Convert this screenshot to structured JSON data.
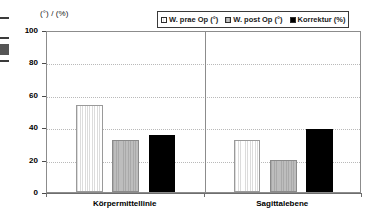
{
  "chart_data": {
    "type": "bar",
    "title": "",
    "subtitle": "",
    "xlabel": "",
    "ylabel": "(°) / (%)",
    "ylim": [
      0,
      100
    ],
    "yticks": [
      0,
      20,
      40,
      60,
      80,
      100
    ],
    "ytick_labels": [
      "0",
      "20",
      "40",
      "60",
      "80",
      "100"
    ],
    "grid": true,
    "legend_position": "top-right",
    "categories": [
      "Körpermittellinie",
      "Sagittalebene"
    ],
    "series": [
      {
        "name": "W. prae Op (°)",
        "swatch": "sw-prae",
        "color": "#fcfcfc",
        "values": [
          54,
          32
        ]
      },
      {
        "name": "W. post Op (°)",
        "swatch": "sw-post",
        "color": "#b3b3b3",
        "values": [
          32,
          20
        ]
      },
      {
        "name": "Korrektur (%)",
        "swatch": "sw-korr",
        "color": "#000000",
        "values": [
          35,
          39
        ]
      }
    ]
  },
  "axis": {
    "y_title": "(°) / (%)"
  }
}
